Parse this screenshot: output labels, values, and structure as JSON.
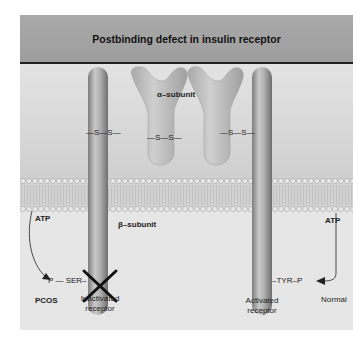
{
  "title": "Postbinding defect in insulin receptor",
  "labels": {
    "alpha_subunit": "α–subunit",
    "beta_subunit": "β–subunit",
    "ss_left": "—S—S—",
    "ss_middle": "—S—S—",
    "ss_right": "—S—S—",
    "atp_left": "ATP",
    "atp_right": "ATP",
    "p_ser": "P — SER–",
    "tyr_p": "–TYR–P",
    "pcos": "PCOS",
    "normal": "Normal",
    "inactivated_line1": "Inactivated",
    "inactivated_line2": "receptor",
    "activated_line1": "Activated",
    "activated_line2": "receptor"
  },
  "colors": {
    "header": "#a3a3a3",
    "background": "#e6e6e6",
    "receptor": "#a8a8a8",
    "membrane_bead": "#d9d9d9",
    "x_mark": "#111111"
  }
}
